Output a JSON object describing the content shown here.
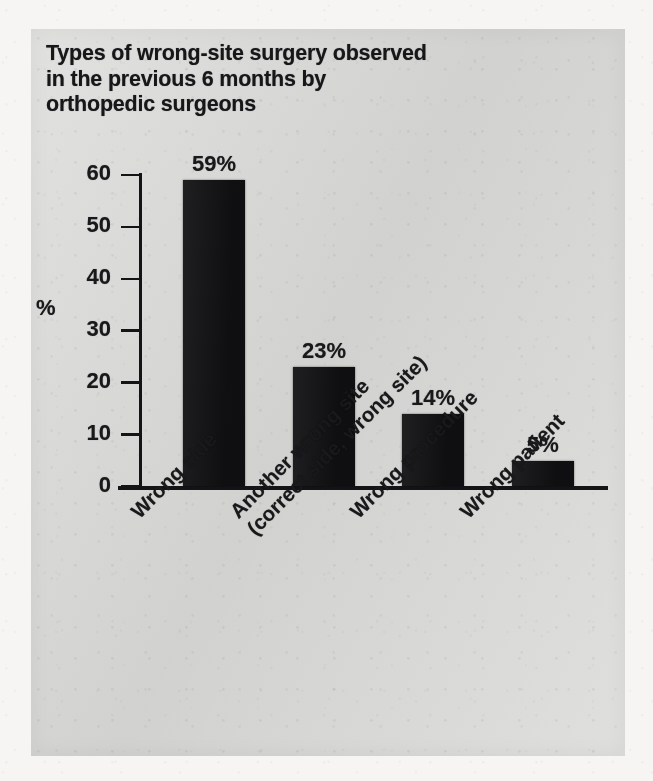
{
  "figure": {
    "title_lines": [
      "Types of wrong-site surgery observed",
      "in the previous 6 months by",
      "orthopedic surgeons"
    ],
    "panel_color": "#d9d9d7",
    "bar_color": "#131315",
    "text_color": "#19191c"
  },
  "chart_data": {
    "type": "bar",
    "title": "Types of wrong-site surgery observed in the previous 6 months by orthopedic surgeons",
    "xlabel": "",
    "ylabel": "%",
    "ylim": [
      0,
      60
    ],
    "ytick_labels": [
      "60",
      "50",
      "40",
      "30",
      "20",
      "10",
      "0"
    ],
    "yticks": [
      60,
      50,
      40,
      30,
      20,
      10,
      0
    ],
    "grid": false,
    "legend": "none",
    "categories": [
      "Wrong side",
      "Another wrong site (correct side, wrong site)",
      "Wrong procedure",
      "Wrong patient"
    ],
    "category_lines": [
      [
        "Wrong side"
      ],
      [
        "Another wrong site",
        "(correct side, wrong site)"
      ],
      [
        "Wrong procedure"
      ],
      [
        "Wrong patient"
      ]
    ],
    "values": [
      59,
      23,
      14,
      5
    ],
    "value_labels": [
      "59%",
      "23%",
      "14%",
      "5%"
    ]
  },
  "bleed_through": [
    {
      "text": "in the previous months of",
      "x": 402,
      "y": 46
    },
    {
      "text": "the reported cases were",
      "x": 418,
      "y": 206
    },
    {
      "text": "surgical site marking",
      "x": 430,
      "y": 228
    },
    {
      "text": "a survey of members",
      "x": 60,
      "y": 652
    },
    {
      "text": "identified errors in the",
      "x": 60,
      "y": 676
    },
    {
      "text": "indicated that wrong-site",
      "x": 60,
      "y": 700
    },
    {
      "text": "surgery remains a concern",
      "x": 60,
      "y": 724
    }
  ]
}
